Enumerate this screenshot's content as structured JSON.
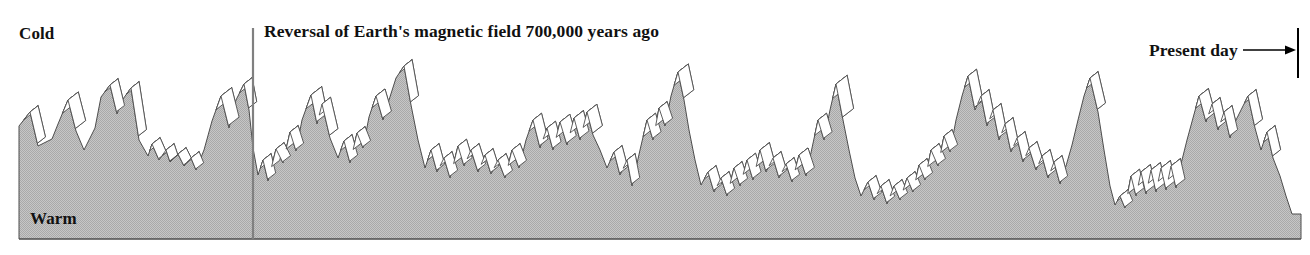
{
  "figure": {
    "type": "paleoclimate-profile",
    "labels": {
      "cold": "Cold",
      "warm": "Warm",
      "reversal": "Reversal of Earth's magnetic field  700,000 years ago",
      "present_day": "Present day"
    },
    "colors": {
      "fill_gray": "#b9b9b9",
      "outline": "#4d4d4d",
      "face_white": "#ffffff",
      "text": "#111111",
      "marker_line": "#808080",
      "present_tick": "#000000",
      "background": "#ffffff"
    },
    "annotations": {
      "reversal_marker_x": 253,
      "reversal_marker_y_top": 28,
      "reversal_marker_y_bottom": 239,
      "present_tick_x": 1298,
      "present_tick_y_top": 28,
      "present_tick_y_bottom": 78,
      "arrow_from_x": 1243,
      "arrow_to_x": 1296,
      "arrow_y": 50
    }
  },
  "chart_data": {
    "type": "area",
    "title": "",
    "subtitle": "",
    "xlabel": "",
    "ylabel": "Temperature (relative)",
    "grid": false,
    "legend": "none",
    "axis_notes": {
      "y_top_meaning": "Cold",
      "y_bottom_meaning": "Warm",
      "x_right_meaning": "Present day",
      "x_marker_meaning": "Reversal of Earth's magnetic field 700,000 years ago"
    },
    "baseline_y": 239,
    "x_start": 19,
    "x_end": 1301,
    "y_top_limit": 60,
    "depth_dx": 18,
    "depth_dy": -14,
    "series": [
      {
        "name": "Paleotemperature profile",
        "comment": "Sawtooth glacial/interglacial ridge outline; x,y in pixel coords, y smaller = colder",
        "points": [
          [
            19,
            126
          ],
          [
            19,
            239
          ],
          [
            19,
            126
          ],
          [
            30,
            112
          ],
          [
            38,
            146
          ],
          [
            52,
            139
          ],
          [
            58,
            124
          ],
          [
            68,
            100
          ],
          [
            76,
            131
          ],
          [
            84,
            150
          ],
          [
            95,
            128
          ],
          [
            101,
            97
          ],
          [
            110,
            85
          ],
          [
            117,
            114
          ],
          [
            123,
            99
          ],
          [
            131,
            88
          ],
          [
            139,
            140
          ],
          [
            148,
            156
          ],
          [
            152,
            144
          ],
          [
            159,
            160
          ],
          [
            166,
            150
          ],
          [
            170,
            162
          ],
          [
            178,
            154
          ],
          [
            184,
            166
          ],
          [
            191,
            158
          ],
          [
            196,
            170
          ],
          [
            204,
            150
          ],
          [
            212,
            121
          ],
          [
            221,
            96
          ],
          [
            229,
            128
          ],
          [
            236,
            100
          ],
          [
            244,
            84
          ],
          [
            249,
            110
          ],
          [
            253,
            148
          ],
          [
            258,
            175
          ],
          [
            263,
            160
          ],
          [
            268,
            181
          ],
          [
            276,
            149
          ],
          [
            283,
            163
          ],
          [
            290,
            132
          ],
          [
            296,
            151
          ],
          [
            302,
            120
          ],
          [
            311,
            95
          ],
          [
            317,
            124
          ],
          [
            322,
            104
          ],
          [
            330,
            138
          ],
          [
            338,
            158
          ],
          [
            344,
            141
          ],
          [
            350,
            163
          ],
          [
            357,
            133
          ],
          [
            363,
            148
          ],
          [
            369,
            117
          ],
          [
            376,
            96
          ],
          [
            383,
            120
          ],
          [
            389,
            100
          ],
          [
            396,
            78
          ],
          [
            404,
            66
          ],
          [
            411,
            105
          ],
          [
            418,
            140
          ],
          [
            425,
            168
          ],
          [
            431,
            150
          ],
          [
            437,
            172
          ],
          [
            444,
            158
          ],
          [
            450,
            178
          ],
          [
            458,
            146
          ],
          [
            464,
            166
          ],
          [
            471,
            150
          ],
          [
            478,
            172
          ],
          [
            485,
            155
          ],
          [
            491,
            174
          ],
          [
            498,
            160
          ],
          [
            505,
            178
          ],
          [
            512,
            150
          ],
          [
            519,
            168
          ],
          [
            526,
            140
          ],
          [
            533,
            120
          ],
          [
            540,
            148
          ],
          [
            547,
            128
          ],
          [
            553,
            150
          ],
          [
            560,
            122
          ],
          [
            567,
            145
          ],
          [
            574,
            118
          ],
          [
            580,
            140
          ],
          [
            587,
            112
          ],
          [
            593,
            135
          ],
          [
            600,
            150
          ],
          [
            607,
            168
          ],
          [
            614,
            152
          ],
          [
            620,
            175
          ],
          [
            627,
            160
          ],
          [
            632,
            186
          ],
          [
            640,
            150
          ],
          [
            647,
            120
          ],
          [
            653,
            140
          ],
          [
            659,
            108
          ],
          [
            665,
            126
          ],
          [
            671,
            96
          ],
          [
            678,
            72
          ],
          [
            684,
            100
          ],
          [
            689,
            130
          ],
          [
            695,
            160
          ],
          [
            701,
            185
          ],
          [
            708,
            172
          ],
          [
            714,
            192
          ],
          [
            721,
            178
          ],
          [
            727,
            196
          ],
          [
            734,
            168
          ],
          [
            740,
            186
          ],
          [
            747,
            160
          ],
          [
            753,
            180
          ],
          [
            760,
            150
          ],
          [
            766,
            172
          ],
          [
            773,
            158
          ],
          [
            779,
            178
          ],
          [
            786,
            164
          ],
          [
            792,
            182
          ],
          [
            799,
            155
          ],
          [
            806,
            176
          ],
          [
            812,
            148
          ],
          [
            818,
            120
          ],
          [
            824,
            140
          ],
          [
            830,
            110
          ],
          [
            836,
            84
          ],
          [
            843,
            120
          ],
          [
            849,
            150
          ],
          [
            855,
            178
          ],
          [
            861,
            196
          ],
          [
            868,
            182
          ],
          [
            874,
            200
          ],
          [
            881,
            186
          ],
          [
            887,
            204
          ],
          [
            894,
            186
          ],
          [
            900,
            200
          ],
          [
            907,
            178
          ],
          [
            913,
            192
          ],
          [
            919,
            165
          ],
          [
            925,
            180
          ],
          [
            931,
            150
          ],
          [
            938,
            166
          ],
          [
            944,
            136
          ],
          [
            950,
            152
          ],
          [
            956,
            120
          ],
          [
            962,
            96
          ],
          [
            968,
            76
          ],
          [
            975,
            110
          ],
          [
            981,
            96
          ],
          [
            987,
            126
          ],
          [
            993,
            110
          ],
          [
            999,
            140
          ],
          [
            1005,
            124
          ],
          [
            1011,
            152
          ],
          [
            1017,
            138
          ],
          [
            1023,
            162
          ],
          [
            1029,
            148
          ],
          [
            1036,
            170
          ],
          [
            1042,
            156
          ],
          [
            1048,
            178
          ],
          [
            1054,
            162
          ],
          [
            1060,
            184
          ],
          [
            1066,
            166
          ],
          [
            1072,
            145
          ],
          [
            1078,
            120
          ],
          [
            1084,
            96
          ],
          [
            1090,
            78
          ],
          [
            1098,
            112
          ],
          [
            1104,
            150
          ],
          [
            1110,
            186
          ],
          [
            1115,
            205
          ],
          [
            1120,
            196
          ],
          [
            1125,
            208
          ],
          [
            1131,
            176
          ],
          [
            1136,
            196
          ],
          [
            1141,
            172
          ],
          [
            1146,
            194
          ],
          [
            1151,
            170
          ],
          [
            1156,
            192
          ],
          [
            1161,
            168
          ],
          [
            1166,
            190
          ],
          [
            1171,
            166
          ],
          [
            1176,
            188
          ],
          [
            1181,
            164
          ],
          [
            1187,
            140
          ],
          [
            1193,
            118
          ],
          [
            1199,
            96
          ],
          [
            1206,
            122
          ],
          [
            1212,
            104
          ],
          [
            1218,
            130
          ],
          [
            1224,
            112
          ],
          [
            1230,
            138
          ],
          [
            1236,
            120
          ],
          [
            1242,
            108
          ],
          [
            1248,
            96
          ],
          [
            1255,
            128
          ],
          [
            1261,
            150
          ],
          [
            1267,
            132
          ],
          [
            1273,
            158
          ],
          [
            1280,
            176
          ],
          [
            1286,
            196
          ],
          [
            1292,
            214
          ],
          [
            1301,
            214
          ],
          [
            1301,
            239
          ]
        ]
      }
    ],
    "peak_count": 0
  }
}
